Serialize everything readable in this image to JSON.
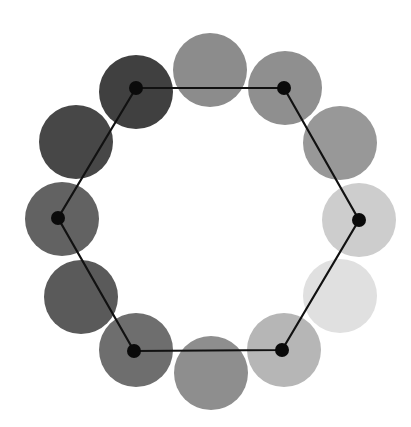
{
  "diagram": {
    "title": "",
    "background": "#ffffff",
    "circle_radius": 37,
    "circles": [
      {
        "id": "top",
        "cx": 210,
        "cy": 70,
        "fill": "#8c8c8c"
      },
      {
        "id": "top-right",
        "cx": 285,
        "cy": 88,
        "fill": "#8f8f8f"
      },
      {
        "id": "right-upper",
        "cx": 340,
        "cy": 143,
        "fill": "#989898"
      },
      {
        "id": "right",
        "cx": 359,
        "cy": 220,
        "fill": "#cdcdcd"
      },
      {
        "id": "right-lower",
        "cx": 340,
        "cy": 296,
        "fill": "#e0e0e0"
      },
      {
        "id": "bottom-right",
        "cx": 284,
        "cy": 350,
        "fill": "#b6b6b6"
      },
      {
        "id": "bottom",
        "cx": 211,
        "cy": 373,
        "fill": "#8e8e8e"
      },
      {
        "id": "bottom-left",
        "cx": 136,
        "cy": 350,
        "fill": "#6e6e6e"
      },
      {
        "id": "left-lower",
        "cx": 81,
        "cy": 297,
        "fill": "#5a5a5a"
      },
      {
        "id": "left",
        "cx": 62,
        "cy": 219,
        "fill": "#626262"
      },
      {
        "id": "left-upper",
        "cx": 76,
        "cy": 142,
        "fill": "#474747"
      },
      {
        "id": "top-left",
        "cx": 136,
        "cy": 92,
        "fill": "#404040"
      }
    ],
    "hexagon": {
      "stroke": "#111111",
      "stroke_width": 2.2,
      "vertex_radius": 7,
      "vertex_fill": "#0a0a0a",
      "vertices": [
        {
          "x": 136,
          "y": 88
        },
        {
          "x": 284,
          "y": 88
        },
        {
          "x": 359,
          "y": 220
        },
        {
          "x": 282,
          "y": 350
        },
        {
          "x": 134,
          "y": 351
        },
        {
          "x": 58,
          "y": 218
        }
      ]
    }
  }
}
